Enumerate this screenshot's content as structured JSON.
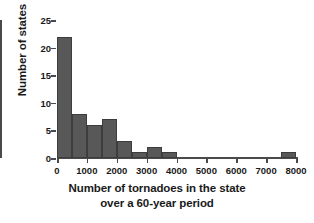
{
  "chart_data": {
    "type": "bar",
    "title": "",
    "xlabel": "Number of tornadoes in the state over a 60-year period",
    "xlabel_line1": "Number of tornadoes in the state",
    "xlabel_line2": "over a 60-year period",
    "ylabel": "Number of states",
    "xlim": [
      0,
      8000
    ],
    "ylim": [
      0,
      25
    ],
    "bin_width": 500,
    "grid": false,
    "legend": false,
    "bar_color": "#585858",
    "bar_edge_color": "#3d3d3d",
    "axis_color": "#4a4a4a",
    "xticks": [
      0,
      1000,
      2000,
      3000,
      4000,
      5000,
      6000,
      7000,
      8000
    ],
    "xtick_labels": [
      "0",
      "1000",
      "2000",
      "3000",
      "4000",
      "5000",
      "6000",
      "7000",
      "8000"
    ],
    "yticks": [
      0,
      5,
      10,
      15,
      20,
      25
    ],
    "ytick_labels": [
      "0",
      "5",
      "10",
      "15",
      "20",
      "25"
    ],
    "bins": [
      {
        "x0": 0,
        "x1": 500,
        "count": 22
      },
      {
        "x0": 500,
        "x1": 1000,
        "count": 8
      },
      {
        "x0": 1000,
        "x1": 1500,
        "count": 6
      },
      {
        "x0": 1500,
        "x1": 2000,
        "count": 7
      },
      {
        "x0": 2000,
        "x1": 2500,
        "count": 3
      },
      {
        "x0": 2500,
        "x1": 3000,
        "count": 1
      },
      {
        "x0": 3000,
        "x1": 3500,
        "count": 2
      },
      {
        "x0": 3500,
        "x1": 4000,
        "count": 1
      },
      {
        "x0": 4000,
        "x1": 4500,
        "count": 0
      },
      {
        "x0": 4500,
        "x1": 5000,
        "count": 0
      },
      {
        "x0": 5000,
        "x1": 5500,
        "count": 0
      },
      {
        "x0": 5500,
        "x1": 6000,
        "count": 0
      },
      {
        "x0": 6000,
        "x1": 6500,
        "count": 0
      },
      {
        "x0": 6500,
        "x1": 7000,
        "count": 0
      },
      {
        "x0": 7000,
        "x1": 7500,
        "count": 0
      },
      {
        "x0": 7500,
        "x1": 8000,
        "count": 1
      }
    ],
    "categories": [
      "0-500",
      "500-1000",
      "1000-1500",
      "1500-2000",
      "2000-2500",
      "2500-3000",
      "3000-3500",
      "3500-4000",
      "4000-4500",
      "4500-5000",
      "5000-5500",
      "5500-6000",
      "6000-6500",
      "6500-7000",
      "7000-7500",
      "7500-8000"
    ],
    "values": [
      22,
      8,
      6,
      7,
      3,
      1,
      2,
      1,
      0,
      0,
      0,
      0,
      0,
      0,
      0,
      1
    ]
  }
}
